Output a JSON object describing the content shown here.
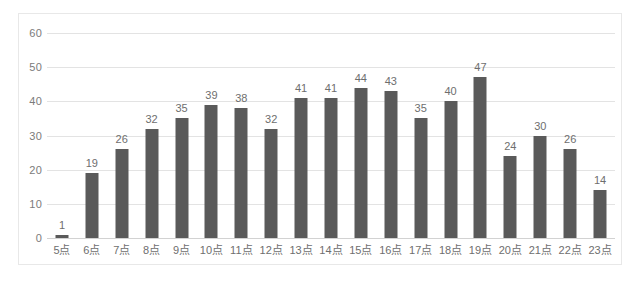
{
  "chart_data": {
    "type": "bar",
    "title": "",
    "subtitle": "",
    "xlabel": "",
    "ylabel": "",
    "categories": [
      "5点",
      "6点",
      "7点",
      "8点",
      "9点",
      "10点",
      "11点",
      "12点",
      "13点",
      "14点",
      "15点",
      "16点",
      "17点",
      "18点",
      "19点",
      "20点",
      "21点",
      "22点",
      "23点"
    ],
    "values": [
      1,
      19,
      26,
      32,
      35,
      39,
      38,
      32,
      41,
      41,
      44,
      43,
      35,
      40,
      47,
      24,
      30,
      26,
      14
    ],
    "data_labels": [
      "1",
      "19",
      "26",
      "32",
      "35",
      "39",
      "38",
      "32",
      "41",
      "41",
      "44",
      "43",
      "35",
      "40",
      "47",
      "24",
      "30",
      "26",
      "14"
    ],
    "ylim": [
      0,
      60
    ],
    "y_ticks": [
      0,
      10,
      20,
      30,
      40,
      50,
      60
    ],
    "y_tick_labels": [
      "0",
      "10",
      "20",
      "30",
      "40",
      "50",
      "60"
    ],
    "grid": true,
    "legend": null,
    "legend_position": "none",
    "series": [
      {
        "name": "",
        "values": [
          1,
          19,
          26,
          32,
          35,
          39,
          38,
          32,
          41,
          41,
          44,
          43,
          35,
          40,
          47,
          24,
          30,
          26,
          14
        ]
      }
    ]
  },
  "style": {
    "bar_color": "#5a5a5a",
    "gridline_color": "#e3e3e3",
    "baseline_color": "#d2d2d2",
    "frame_color": "#e8e8e8",
    "tick_label_color": "#6e6e6e",
    "y_label_color": "#7b7b7b",
    "background": "#ffffff"
  }
}
